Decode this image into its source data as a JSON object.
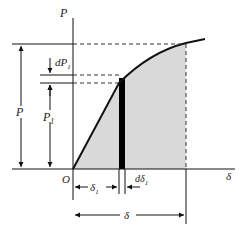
{
  "diagram": {
    "type": "load-displacement curve",
    "labels": {
      "y_axis": "P",
      "x_axis": "δ",
      "origin": "O",
      "P_total": "P",
      "P1": "P",
      "P1_sub": "1",
      "dP1": "dP",
      "dP1_sub": "1",
      "delta1": "δ",
      "delta1_sub": "1",
      "d_delta1": "dδ",
      "d_delta1_sub": "1",
      "delta_total": "δ"
    },
    "colors": {
      "line": "#111111",
      "shaded": "#d9d9d9",
      "strip": "#000000",
      "background": "#ffffff"
    }
  }
}
